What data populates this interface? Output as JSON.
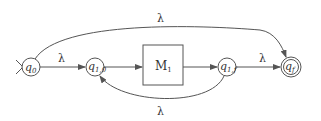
{
  "diagram": {
    "type": "nfa-kleene-star-construction",
    "colors": {
      "stroke": "#555555",
      "text": "#333333",
      "background": "#ffffff"
    },
    "states": [
      {
        "id": "q0",
        "label": "q",
        "sub": "0",
        "initial": true,
        "final": false
      },
      {
        "id": "q10",
        "label": "q",
        "sub": "1,0",
        "initial": false,
        "final": false
      },
      {
        "id": "q1f",
        "label": "q",
        "sub": "1,f",
        "initial": false,
        "final": false
      },
      {
        "id": "qf",
        "label": "q",
        "sub": "f",
        "initial": false,
        "final": true
      }
    ],
    "machine": {
      "label": "M",
      "sub": "1"
    },
    "transitions": [
      {
        "from": "q0",
        "to": "q10",
        "label": "λ"
      },
      {
        "from": "q10",
        "to": "M1",
        "label": ""
      },
      {
        "from": "M1",
        "to": "q1f",
        "label": ""
      },
      {
        "from": "q1f",
        "to": "qf",
        "label": "λ"
      },
      {
        "from": "q0",
        "to": "qf",
        "label": "λ"
      },
      {
        "from": "q1f",
        "to": "q10",
        "label": "λ"
      }
    ]
  }
}
